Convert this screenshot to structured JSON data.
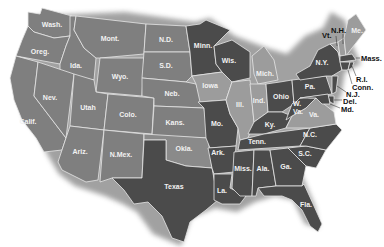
{
  "map": {
    "title": "United States",
    "colors": {
      "medium": "#7f7f7f",
      "light": "#9c9c9c",
      "dark": "#4b4b4b",
      "border": "#e6e6e6",
      "shadow": "#9a9a9a"
    },
    "states": {
      "wash": "Wash.",
      "oreg": "Oreg.",
      "calif": "Calif.",
      "ida": "Ida.",
      "nev": "Nev.",
      "mont": "Mont.",
      "wyo": "Wyo.",
      "utah": "Utah",
      "ariz": "Ariz.",
      "colo": "Colo.",
      "nmex": "N.Mex.",
      "nd": "N.D.",
      "sd": "S.D.",
      "neb": "Neb.",
      "kans": "Kans.",
      "okla": "Okla.",
      "texas": "Texas",
      "minn": "Minn.",
      "iowa": "Iowa",
      "mo": "Mo.",
      "ark": "Ark.",
      "la": "La.",
      "wis": "Wis.",
      "ill": "Ill.",
      "mich": "Mich.",
      "ind": "Ind.",
      "ohio": "Ohio",
      "ky": "Ky.",
      "tenn": "Tenn.",
      "miss": "Miss.",
      "ala": "Ala.",
      "ga": "Ga.",
      "fla": "Fla.",
      "sc": "S.C.",
      "nc": "N.C.",
      "va": "Va.",
      "wva1": "W.",
      "wva2": "Va.",
      "pa": "Pa.",
      "ny": "N.Y.",
      "vt": "Vt.",
      "nh": "N.H.",
      "me": "Me.",
      "mass": "Mass.",
      "ri": "R.I.",
      "conn": "Conn.",
      "nj": "N.J.",
      "del": "Del.",
      "md": "Md."
    }
  }
}
